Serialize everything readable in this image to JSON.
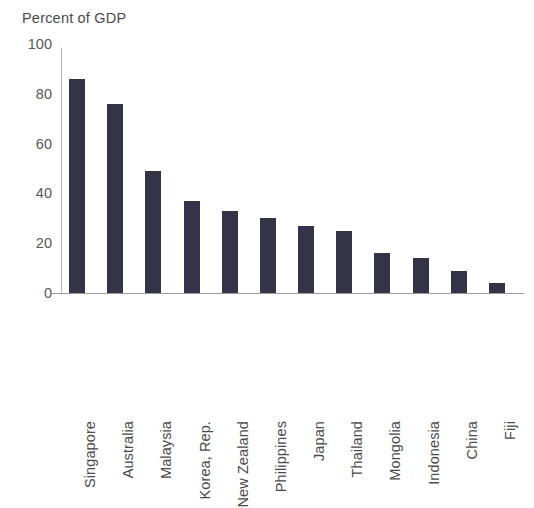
{
  "chart_data": {
    "type": "bar",
    "title": "Percent of GDP",
    "subtitle": "",
    "xlabel": "",
    "ylabel": "",
    "ylim": [
      0,
      100
    ],
    "yticks": [
      0,
      20,
      40,
      60,
      80,
      100
    ],
    "ytick_labels": [
      "0",
      "20",
      "40",
      "60",
      "80",
      "100"
    ],
    "grid": false,
    "legend": false,
    "legend_position": "none",
    "bar_color": "#353348",
    "axis_color": "#9a9a9c",
    "text_color": "#4a4a4a",
    "background_color": "#ffffff",
    "categories": [
      "Singapore",
      "Australia",
      "Malaysia",
      "Korea, Rep.",
      "New Zealand",
      "Philippines",
      "Japan",
      "Thailand",
      "Mongolia",
      "Indonesia",
      "China",
      "Fiji"
    ],
    "values": [
      86,
      76,
      49,
      37,
      33,
      30,
      27,
      25,
      16,
      14,
      9,
      4
    ],
    "annotations": []
  }
}
